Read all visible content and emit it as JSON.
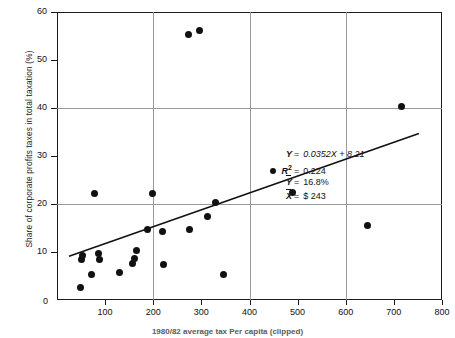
{
  "chart_data": {
    "type": "scatter",
    "title": "",
    "xlabel": "",
    "ylabel": "Share of corporate profits taxes in total taxation (%)",
    "xlim": [
      0,
      800
    ],
    "ylim": [
      0,
      60
    ],
    "xticks": [
      100,
      200,
      300,
      400,
      500,
      600,
      700,
      800
    ],
    "yticks": [
      0,
      10,
      20,
      30,
      40,
      50,
      60
    ],
    "xtick_labels": [
      "100",
      "200",
      "300",
      "400",
      "500",
      "600",
      "700",
      "800"
    ],
    "ytick_labels": [
      "0",
      "10",
      "20",
      "30",
      "40",
      "50",
      "60"
    ],
    "origin_label": "0",
    "grid": "major gridlines at y = 20, 40 and x = 200, 400, 600",
    "gridlines_y": [
      20,
      40
    ],
    "gridlines_x": [
      200,
      400,
      600
    ],
    "legend": "none",
    "points": [
      {
        "x": 48,
        "y": 2.6
      },
      {
        "x": 50,
        "y": 8.4
      },
      {
        "x": 54,
        "y": 9.3
      },
      {
        "x": 72,
        "y": 5.4
      },
      {
        "x": 78,
        "y": 22.1
      },
      {
        "x": 86,
        "y": 9.6
      },
      {
        "x": 88,
        "y": 8.5
      },
      {
        "x": 130,
        "y": 5.8
      },
      {
        "x": 156,
        "y": 7.6
      },
      {
        "x": 160,
        "y": 8.7
      },
      {
        "x": 166,
        "y": 10.4
      },
      {
        "x": 188,
        "y": 14.6
      },
      {
        "x": 199,
        "y": 22.1
      },
      {
        "x": 219,
        "y": 14.2
      },
      {
        "x": 222,
        "y": 7.5
      },
      {
        "x": 274,
        "y": 55.4
      },
      {
        "x": 276,
        "y": 14.7
      },
      {
        "x": 297,
        "y": 56.1
      },
      {
        "x": 313,
        "y": 17.4
      },
      {
        "x": 330,
        "y": 20.4
      },
      {
        "x": 345,
        "y": 5.4
      },
      {
        "x": 490,
        "y": 22.3
      },
      {
        "x": 645,
        "y": 15.6
      },
      {
        "x": 716,
        "y": 40.4
      }
    ],
    "trendline": {
      "slope": 0.0352,
      "intercept": 8.21,
      "x_start": 25,
      "x_end": 752
    },
    "annotations": {
      "equation": {
        "symbol": "Y",
        "equals": "=",
        "value": "0.0352X + 8.21"
      },
      "r_squared": {
        "symbol": "R",
        "exponent": "2",
        "equals": "=",
        "value": "0.224"
      },
      "y_mean": {
        "symbol": "Y",
        "equals": "=",
        "value": "16.8%"
      },
      "x_mean": {
        "symbol": "X",
        "equals": "=",
        "value": "$ 243"
      }
    }
  },
  "caption": "1980/82 average tax Per capita (clipped)",
  "top_strip": ""
}
